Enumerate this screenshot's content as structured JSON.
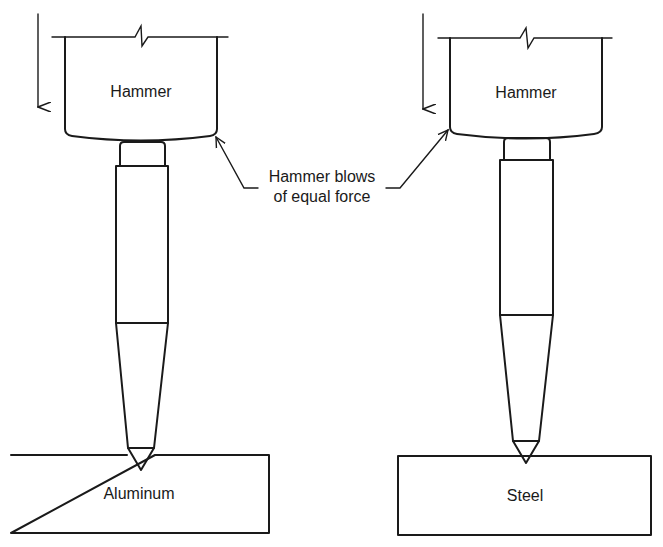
{
  "diagram": {
    "left": {
      "hammer_label": "Hammer",
      "material_label": "Aluminum"
    },
    "right": {
      "hammer_label": "Hammer",
      "material_label": "Steel"
    },
    "callout": {
      "line1": "Hammer blows",
      "line2": "of equal force"
    },
    "colors": {
      "ink": "#1a1a1a",
      "background": "#ffffff"
    }
  }
}
